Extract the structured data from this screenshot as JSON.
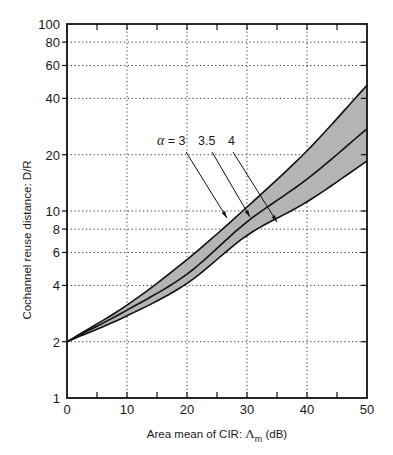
{
  "chart_data": {
    "type": "line",
    "title": "",
    "xlabel": "Area mean of CIR:  Λm (dB)",
    "xlabel_parts": {
      "prefix": "Area mean of CIR:",
      "symbol": "Λ",
      "subscript": "m",
      "unit": "(dB)"
    },
    "ylabel": "Cochannel reuse distance:  D/R",
    "x_scale": "linear",
    "y_scale": "log",
    "xlim": [
      0,
      50
    ],
    "ylim": [
      1,
      100
    ],
    "x_ticks": [
      0,
      10,
      20,
      30,
      40,
      50
    ],
    "x_minor_ticks": [
      5,
      15,
      25,
      35,
      45
    ],
    "y_ticks": [
      1,
      2,
      4,
      6,
      8,
      10,
      20,
      40,
      60,
      80,
      100
    ],
    "grid": {
      "on": true,
      "style": "dotted",
      "x": [
        10,
        20,
        30,
        40
      ],
      "y": [
        2,
        4,
        6,
        8,
        10,
        20,
        40,
        60,
        80
      ]
    },
    "x": [
      0,
      10,
      20,
      30,
      40,
      50
    ],
    "series": [
      {
        "name": "α = 3",
        "values": [
          2,
          3.14,
          5.5,
          10.5,
          21,
          47
        ]
      },
      {
        "name": "3.5",
        "values": [
          2,
          2.95,
          4.6,
          8.75,
          14.8,
          27.5
        ]
      },
      {
        "name": "4",
        "values": [
          2,
          2.75,
          4.1,
          7.4,
          11.2,
          18.5
        ]
      }
    ],
    "shaded_band": {
      "between": [
        "α = 3",
        "4"
      ],
      "color": "#b4b4b4"
    },
    "annotations": [
      {
        "text": "α = 3",
        "label_at": [
          157,
          145
        ],
        "line_from": [
          186,
          152
        ],
        "arrow_to": [
          227,
          218
        ]
      },
      {
        "text": "3.5",
        "label_at": [
          198,
          145
        ],
        "line_from": [
          212,
          152
        ],
        "arrow_to": [
          250,
          217
        ]
      },
      {
        "text": "4",
        "label_at": [
          228,
          145
        ],
        "line_from": [
          233,
          152
        ],
        "arrow_to": [
          277,
          222
        ]
      }
    ],
    "legend": {
      "position": "none"
    }
  }
}
